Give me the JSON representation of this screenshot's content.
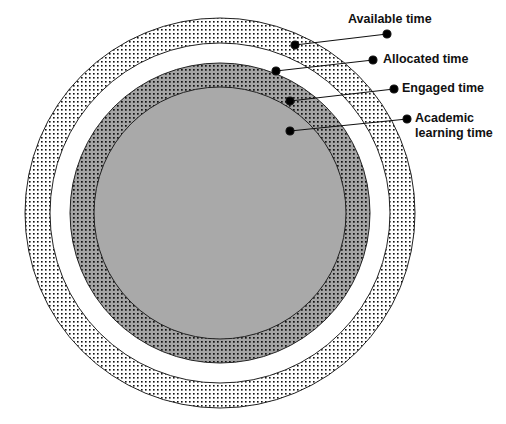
{
  "diagram": {
    "type": "nested-circles",
    "center": [
      220,
      213
    ],
    "rings": [
      {
        "name": "Available time",
        "radius": 195,
        "fill": "#ffffff",
        "pattern": "dots-light"
      },
      {
        "name": "Allocated time",
        "radius": 170,
        "fill": "#ffffff",
        "pattern": "none"
      },
      {
        "name": "Engaged time",
        "radius": 150,
        "fill": "#a8a8a8",
        "pattern": "dots-dark"
      },
      {
        "name": "Academic learning time",
        "radius": 126,
        "fill": "#a9a9a9",
        "pattern": "none"
      }
    ]
  },
  "labels": {
    "available": "Available time",
    "allocated": "Allocated time",
    "engaged": "Engaged time",
    "academic_line1": "Academic",
    "academic_line2": "learning time"
  },
  "colors": {
    "stroke": "#222222",
    "dot": "#111111",
    "grey": "#a9a9a9"
  }
}
